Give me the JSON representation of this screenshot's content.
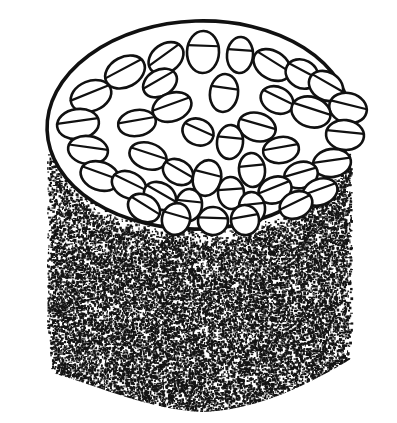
{
  "figure": {
    "title": "Cylindrical specimen with elliptical top face and stippled body",
    "kind": "line-drawing-diagram",
    "width": 397,
    "height": 423,
    "background_color": "#ffffff",
    "ink_color": "#111111",
    "top_face_fill": "#ffffff"
  },
  "top_face": {
    "name": "top-face-ellipse",
    "center_x": 199,
    "center_y": 125,
    "radius_x": 152,
    "radius_y": 104,
    "rotation_deg": -2,
    "outline_width": 3.6,
    "outline_color": "#111111",
    "fill_color": "#ffffff",
    "visible_arc": "full"
  },
  "body": {
    "name": "stippled-cylinder-body",
    "texture": "dense-random-stipple",
    "stipple_color": "#141414",
    "stipple_density": 0.46,
    "dot_min_px": 1,
    "dot_max_px": 3,
    "top_boundary": "follows lower arc of top-face ellipse",
    "left_wall_x": 26,
    "right_wall_x": 372,
    "bottom_bulge_center_y": 404,
    "left_notch_y": 330,
    "right_notch_y": 322,
    "silhouette_note": "Side walls descend from the rim, step inward at left and right notches, then sweep into a broad convex bottom bulge."
  },
  "ovals": {
    "name": "oval-body-group",
    "count": 41,
    "stroke_color": "#111111",
    "stroke_width": 2.6,
    "fill_color": "#ffffff",
    "chord_label": "each oval is crossed by one straight chord line offset from its center",
    "chord_stroke_width": 2.2,
    "arrangement": "three loose concentric rings plus a few central members, major axes tilted roughly tangential to the rings",
    "items": [
      {
        "id": 1,
        "cx": 203,
        "cy": 52,
        "rx": 16,
        "ry": 21,
        "rot": 2,
        "chord": -0.3
      },
      {
        "id": 2,
        "cx": 240,
        "cy": 55,
        "rx": 13,
        "ry": 18,
        "rot": 4,
        "chord": -0.28
      },
      {
        "id": 3,
        "cx": 166,
        "cy": 58,
        "rx": 19,
        "ry": 14,
        "rot": -36,
        "chord": -0.26
      },
      {
        "id": 4,
        "cx": 272,
        "cy": 65,
        "rx": 20,
        "ry": 14,
        "rot": 32,
        "chord": -0.26
      },
      {
        "id": 5,
        "cx": 125,
        "cy": 72,
        "rx": 21,
        "ry": 15,
        "rot": -28,
        "chord": -0.24
      },
      {
        "id": 6,
        "cx": 160,
        "cy": 83,
        "rx": 18,
        "ry": 13,
        "rot": -30,
        "chord": -0.26
      },
      {
        "id": 7,
        "cx": 302,
        "cy": 74,
        "rx": 17,
        "ry": 14,
        "rot": 28,
        "chord": -0.24
      },
      {
        "id": 8,
        "cx": 326,
        "cy": 86,
        "rx": 18,
        "ry": 14,
        "rot": 30,
        "chord": -0.24
      },
      {
        "id": 9,
        "cx": 91,
        "cy": 96,
        "rx": 21,
        "ry": 15,
        "rot": -22,
        "chord": -0.22
      },
      {
        "id": 10,
        "cx": 224,
        "cy": 93,
        "rx": 14,
        "ry": 19,
        "rot": 8,
        "chord": -0.28
      },
      {
        "id": 11,
        "cx": 277,
        "cy": 100,
        "rx": 17,
        "ry": 13,
        "rot": 26,
        "chord": -0.24
      },
      {
        "id": 12,
        "cx": 348,
        "cy": 108,
        "rx": 19,
        "ry": 15,
        "rot": 14,
        "chord": -0.22
      },
      {
        "id": 13,
        "cx": 172,
        "cy": 107,
        "rx": 20,
        "ry": 14,
        "rot": -20,
        "chord": -0.22
      },
      {
        "id": 14,
        "cx": 311,
        "cy": 112,
        "rx": 20,
        "ry": 15,
        "rot": 18,
        "chord": -0.22
      },
      {
        "id": 15,
        "cx": 78,
        "cy": 124,
        "rx": 21,
        "ry": 15,
        "rot": -8,
        "chord": -0.2
      },
      {
        "id": 16,
        "cx": 137,
        "cy": 123,
        "rx": 19,
        "ry": 13,
        "rot": -10,
        "chord": -0.22
      },
      {
        "id": 17,
        "cx": 198,
        "cy": 132,
        "rx": 16,
        "ry": 13,
        "rot": 24,
        "chord": -0.22
      },
      {
        "id": 18,
        "cx": 257,
        "cy": 127,
        "rx": 19,
        "ry": 14,
        "rot": 16,
        "chord": -0.22
      },
      {
        "id": 19,
        "cx": 345,
        "cy": 135,
        "rx": 19,
        "ry": 15,
        "rot": 6,
        "chord": -0.2
      },
      {
        "id": 20,
        "cx": 230,
        "cy": 142,
        "rx": 13,
        "ry": 17,
        "rot": 6,
        "chord": -0.26
      },
      {
        "id": 21,
        "cx": 88,
        "cy": 150,
        "rx": 20,
        "ry": 14,
        "rot": 8,
        "chord": -0.2
      },
      {
        "id": 22,
        "cx": 148,
        "cy": 156,
        "rx": 19,
        "ry": 13,
        "rot": 18,
        "chord": -0.22
      },
      {
        "id": 23,
        "cx": 281,
        "cy": 150,
        "rx": 18,
        "ry": 13,
        "rot": -10,
        "chord": -0.22
      },
      {
        "id": 24,
        "cx": 332,
        "cy": 163,
        "rx": 19,
        "ry": 14,
        "rot": -8,
        "chord": -0.2
      },
      {
        "id": 25,
        "cx": 178,
        "cy": 172,
        "rx": 16,
        "ry": 12,
        "rot": 30,
        "chord": -0.22
      },
      {
        "id": 26,
        "cx": 207,
        "cy": 178,
        "rx": 14,
        "ry": 18,
        "rot": 14,
        "chord": -0.26
      },
      {
        "id": 27,
        "cx": 252,
        "cy": 170,
        "rx": 13,
        "ry": 17,
        "rot": -6,
        "chord": -0.26
      },
      {
        "id": 28,
        "cx": 100,
        "cy": 176,
        "rx": 20,
        "ry": 14,
        "rot": 20,
        "chord": -0.22
      },
      {
        "id": 29,
        "cx": 301,
        "cy": 175,
        "rx": 17,
        "ry": 13,
        "rot": -16,
        "chord": -0.22
      },
      {
        "id": 30,
        "cx": 129,
        "cy": 185,
        "rx": 18,
        "ry": 13,
        "rot": 26,
        "chord": -0.22
      },
      {
        "id": 31,
        "cx": 160,
        "cy": 196,
        "rx": 17,
        "ry": 13,
        "rot": 30,
        "chord": -0.22
      },
      {
        "id": 32,
        "cx": 231,
        "cy": 193,
        "rx": 13,
        "ry": 16,
        "rot": -4,
        "chord": -0.24
      },
      {
        "id": 33,
        "cx": 275,
        "cy": 190,
        "rx": 17,
        "ry": 13,
        "rot": -22,
        "chord": -0.22
      },
      {
        "id": 34,
        "cx": 320,
        "cy": 192,
        "rx": 18,
        "ry": 13,
        "rot": -20,
        "chord": -0.22
      },
      {
        "id": 35,
        "cx": 189,
        "cy": 205,
        "rx": 13,
        "ry": 16,
        "rot": 6,
        "chord": -0.24
      },
      {
        "id": 36,
        "cx": 144,
        "cy": 208,
        "rx": 17,
        "ry": 13,
        "rot": 32,
        "chord": -0.22
      },
      {
        "id": 37,
        "cx": 252,
        "cy": 208,
        "rx": 13,
        "ry": 16,
        "rot": -6,
        "chord": -0.24
      },
      {
        "id": 38,
        "cx": 296,
        "cy": 205,
        "rx": 17,
        "ry": 13,
        "rot": -26,
        "chord": -0.22
      },
      {
        "id": 39,
        "cx": 176,
        "cy": 219,
        "rx": 14,
        "ry": 16,
        "rot": 16,
        "chord": -0.24
      },
      {
        "id": 40,
        "cx": 213,
        "cy": 221,
        "rx": 15,
        "ry": 14,
        "rot": 2,
        "chord": -0.22
      },
      {
        "id": 41,
        "cx": 245,
        "cy": 220,
        "rx": 14,
        "ry": 15,
        "rot": -10,
        "chord": -0.24
      }
    ]
  }
}
